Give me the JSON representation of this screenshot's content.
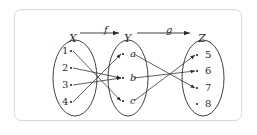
{
  "diagram": {
    "frame": {
      "stroke": "#d8d8d8",
      "fill": "#ffffff"
    },
    "ink": "#2b2b2b",
    "sets": [
      {
        "id": "X",
        "name": "X",
        "cx": 75,
        "cy": 78,
        "rx": 22,
        "ry": 38,
        "elements": [
          {
            "label": "1",
            "x": 62,
            "y": 51,
            "dot_x": 71,
            "dot_y": 51,
            "style": "upright"
          },
          {
            "label": "2",
            "x": 62,
            "y": 68,
            "dot_x": 71,
            "dot_y": 68,
            "style": "upright"
          },
          {
            "label": "3",
            "x": 62,
            "y": 85,
            "dot_x": 71,
            "dot_y": 85,
            "style": "upright"
          },
          {
            "label": "4",
            "x": 62,
            "y": 102,
            "dot_x": 71,
            "dot_y": 102,
            "style": "upright"
          }
        ]
      },
      {
        "id": "Y",
        "name": "Y",
        "cx": 128,
        "cy": 78,
        "rx": 20,
        "ry": 38,
        "elements": [
          {
            "label": "a",
            "x": 130,
            "y": 54,
            "dot_x": 123,
            "dot_y": 54,
            "style": "italic"
          },
          {
            "label": "b",
            "x": 130,
            "y": 78,
            "dot_x": 123,
            "dot_y": 78,
            "style": "italic"
          },
          {
            "label": "c",
            "x": 130,
            "y": 101,
            "dot_x": 123,
            "dot_y": 101,
            "style": "italic"
          }
        ]
      },
      {
        "id": "Z",
        "name": "Z",
        "cx": 203,
        "cy": 78,
        "rx": 21,
        "ry": 38,
        "elements": [
          {
            "label": "5",
            "x": 205,
            "y": 55,
            "dot_x": 197,
            "dot_y": 55,
            "style": "upright"
          },
          {
            "label": "6",
            "x": 205,
            "y": 71,
            "dot_x": 197,
            "dot_y": 71,
            "style": "upright"
          },
          {
            "label": "7",
            "x": 205,
            "y": 88,
            "dot_x": 197,
            "dot_y": 88,
            "style": "upright"
          },
          {
            "label": "8",
            "x": 205,
            "y": 104,
            "dot_x": 197,
            "dot_y": 104,
            "style": "upright"
          }
        ]
      }
    ],
    "set_labels": [
      {
        "name": "X",
        "x": 69,
        "y": 33
      },
      {
        "name": "Y",
        "x": 124,
        "y": 33
      },
      {
        "name": "Z",
        "x": 198,
        "y": 33
      }
    ],
    "maps": [
      {
        "name": "f",
        "label_x": 104,
        "label_y": 25,
        "from": "X",
        "to": "Y",
        "arrow": {
          "x1": 80,
          "y1": 33,
          "x2": 119,
          "y2": 33
        }
      },
      {
        "name": "g",
        "label_x": 166,
        "label_y": 25,
        "from": "Y",
        "to": "Z",
        "arrow": {
          "x1": 137,
          "y1": 33,
          "x2": 190,
          "y2": 33
        }
      }
    ],
    "edges_f": [
      {
        "from": "1",
        "to": "c",
        "x1": 73,
        "y1": 51,
        "x2": 121,
        "y2": 101
      },
      {
        "from": "2",
        "to": "b",
        "x1": 73,
        "y1": 68,
        "x2": 121,
        "y2": 78
      },
      {
        "from": "3",
        "to": "b",
        "x1": 73,
        "y1": 85,
        "x2": 121,
        "y2": 78
      },
      {
        "from": "4",
        "to": "a",
        "x1": 73,
        "y1": 102,
        "x2": 121,
        "y2": 54
      }
    ],
    "edges_g": [
      {
        "from": "a",
        "to": "7",
        "x1": 134,
        "y1": 54,
        "x2": 195,
        "y2": 88
      },
      {
        "from": "b",
        "to": "6",
        "x1": 134,
        "y1": 78,
        "x2": 195,
        "y2": 71
      },
      {
        "from": "c",
        "to": "5",
        "x1": 134,
        "y1": 101,
        "x2": 195,
        "y2": 55
      }
    ],
    "unmapped": [
      "8"
    ]
  },
  "chart_data": {
    "type": "diagram",
    "domain_set": {
      "name": "X",
      "elements": [
        "1",
        "2",
        "3",
        "4"
      ]
    },
    "middle_set": {
      "name": "Y",
      "elements": [
        "a",
        "b",
        "c"
      ]
    },
    "codomain_set": {
      "name": "Z",
      "elements": [
        "5",
        "6",
        "7",
        "8"
      ]
    },
    "function_f": {
      "name": "f",
      "mapping": {
        "1": "c",
        "2": "b",
        "3": "b",
        "4": "a"
      }
    },
    "function_g": {
      "name": "g",
      "mapping": {
        "a": "7",
        "b": "6",
        "c": "5"
      }
    },
    "composition_gof": {
      "1": "5",
      "2": "6",
      "3": "6",
      "4": "7"
    },
    "elements_without_preimage_in_Z": [
      "8"
    ]
  }
}
